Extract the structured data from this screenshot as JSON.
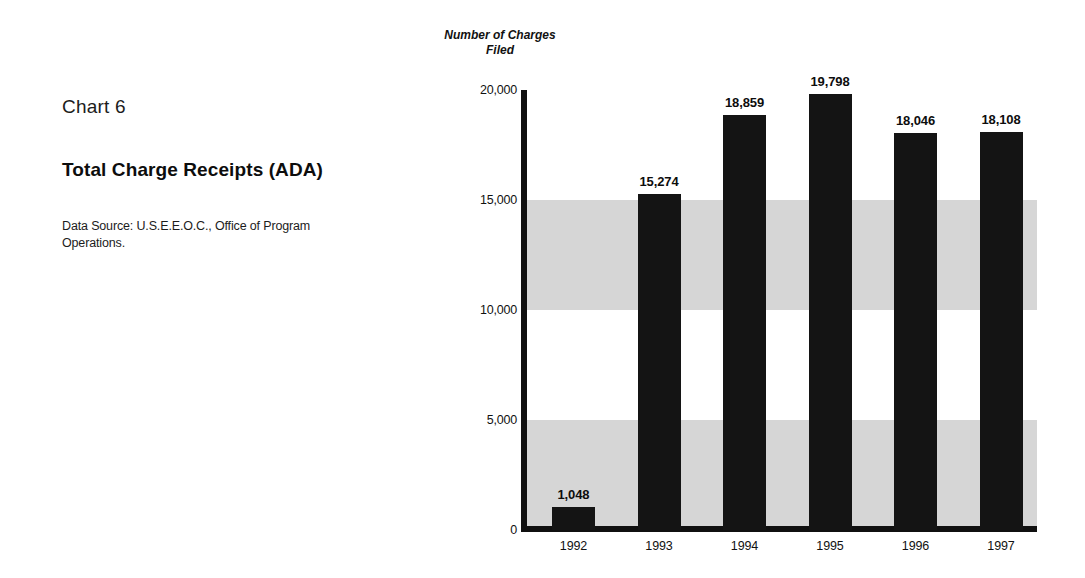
{
  "caption": {
    "chart_number": "Chart 6",
    "title": "Total Charge Receipts (ADA)",
    "source": "Data Source: U.S.E.E.O.C., Office of Program Operations."
  },
  "chart_data": {
    "type": "bar",
    "title": "Total Charge Receipts (ADA)",
    "subtitle": "Chart 6",
    "ylabel": "Number of Charges Filed",
    "xlabel": "",
    "categories": [
      "1992",
      "1993",
      "1994",
      "1995",
      "1996",
      "1997"
    ],
    "values": [
      1048,
      15274,
      18859,
      19798,
      18046,
      18108
    ],
    "value_labels": [
      "1,048",
      "15,274",
      "18,859",
      "19,798",
      "18,046",
      "18,108"
    ],
    "ylim": [
      0,
      20000
    ],
    "yticks": [
      0,
      5000,
      10000,
      15000,
      20000
    ],
    "ytick_labels": [
      "0",
      "5,000",
      "10,000",
      "15,000",
      "20,000"
    ],
    "grid": false,
    "legend": "none",
    "bar_color": "#141414",
    "band_color": "#d6d6d6",
    "shaded_bands": [
      [
        0,
        5000
      ],
      [
        10000,
        15000
      ]
    ]
  }
}
